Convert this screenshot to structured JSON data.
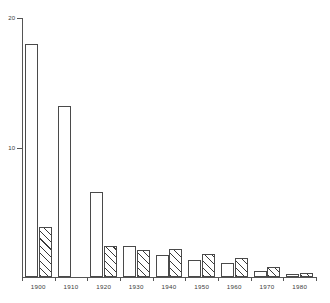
{
  "chart_data": {
    "type": "bar",
    "title": "",
    "subtitle": "",
    "xlabel": "",
    "ylabel": "",
    "categories": [
      "1900",
      "1910",
      "1920",
      "1930",
      "1940",
      "1950",
      "1960",
      "1970",
      "1980"
    ],
    "series": [
      {
        "name": "open-bar",
        "style": "unfilled",
        "values": [
          18.0,
          13.2,
          6.6,
          2.4,
          1.7,
          1.3,
          1.1,
          0.5,
          0.2
        ]
      },
      {
        "name": "hatched-bar",
        "style": "diagonal-hatch",
        "values": [
          3.9,
          0,
          2.4,
          2.1,
          2.2,
          1.8,
          1.5,
          0.8,
          0.3
        ]
      }
    ],
    "ylim": [
      0,
      20
    ],
    "yticks": [
      10,
      20
    ],
    "ytick_labels": [
      "10",
      "20"
    ],
    "xticks": [
      "1900",
      "1910",
      "1920",
      "1930",
      "1940",
      "1950",
      "1960",
      "1970",
      "1980"
    ],
    "grid": false,
    "legend": false,
    "legend_position": "none"
  },
  "axes": {
    "y": {
      "ticks": [
        {
          "label": "20",
          "value": 20
        },
        {
          "label": "10",
          "value": 10
        }
      ]
    },
    "x": {
      "ticks": [
        {
          "label": "1900"
        },
        {
          "label": "1910"
        },
        {
          "label": "1920"
        },
        {
          "label": "1930"
        },
        {
          "label": "1940"
        },
        {
          "label": "1950"
        },
        {
          "label": "1960"
        },
        {
          "label": "1970"
        },
        {
          "label": "1980"
        }
      ]
    }
  },
  "colors": {
    "axis": "#555555",
    "bar_outline": "#4a4a4a",
    "bar_open_fill": "#ffffff",
    "hatch_stroke": "#3a3a3a",
    "background": "#ffffff",
    "text": "#3a3a3a"
  }
}
